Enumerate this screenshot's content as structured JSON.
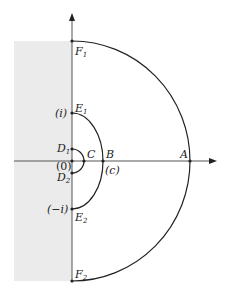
{
  "diagram": {
    "type": "contour-in-complex-plane",
    "colors": {
      "shaded_region": "#ebebeb",
      "stroke": "#222222",
      "axis": "#555555"
    },
    "labels": {
      "F1": {
        "main": "F",
        "sub": "1"
      },
      "F2": {
        "main": "F",
        "sub": "2"
      },
      "E1": {
        "main": "E",
        "sub": "1"
      },
      "E2": {
        "main": "E",
        "sub": "2"
      },
      "D1": {
        "main": "D",
        "sub": "1"
      },
      "D2": {
        "main": "D",
        "sub": "2"
      },
      "A": "A",
      "B": "B",
      "C": "C",
      "i": "(i)",
      "neg_i": "(−i)",
      "zero": "(0)",
      "c": "(c)"
    }
  }
}
